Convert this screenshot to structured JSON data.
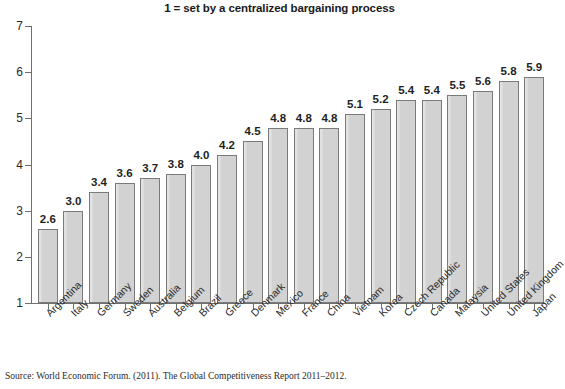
{
  "chart_data": {
    "type": "bar",
    "title": "1 = set by a centralized bargaining process",
    "xlabel": "",
    "ylabel": "",
    "ylim": [
      1,
      7
    ],
    "yticks": [
      1,
      2,
      3,
      4,
      5,
      6,
      7
    ],
    "grid": false,
    "legend": null,
    "orientation": "vertical",
    "bar_color": "#d3d3d3",
    "bar_edge_color": "#7a7a7a",
    "categories": [
      "Argentina",
      "Italy",
      "Germany",
      "Sweden",
      "Australia",
      "Belgium",
      "Brazil",
      "Greece",
      "Denmark",
      "Mexico",
      "France",
      "China",
      "Vietnam",
      "Korea",
      "Czech Republic",
      "Canada",
      "Malaysia",
      "United States",
      "United Kingdom",
      "Japan"
    ],
    "values": [
      2.6,
      3.0,
      3.4,
      3.6,
      3.7,
      3.8,
      4.0,
      4.2,
      4.5,
      4.8,
      4.8,
      4.8,
      5.1,
      5.2,
      5.4,
      5.4,
      5.5,
      5.6,
      5.8,
      5.9
    ],
    "value_labels": [
      "2.6",
      "3.0",
      "3.4",
      "3.6",
      "3.7",
      "3.8",
      "4.0",
      "4.2",
      "4.5",
      "4.8",
      "4.8",
      "4.8",
      "5.1",
      "5.2",
      "5.4",
      "5.4",
      "5.5",
      "5.6",
      "5.8",
      "5.9"
    ],
    "ytick_labels": [
      "1",
      "2",
      "3",
      "4",
      "5",
      "6",
      "7"
    ]
  },
  "source_note": "Source: World Economic Forum. (2011). The Global Competitiveness Report 2011–2012."
}
